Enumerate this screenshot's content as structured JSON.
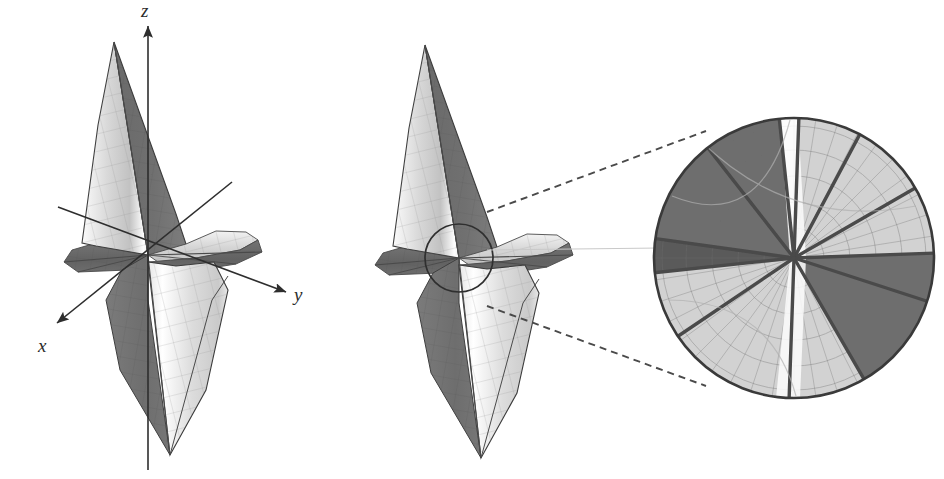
{
  "figure": {
    "type": "mathematical-surface-illustration",
    "rendering": "grayscale-shaded-mesh",
    "background_color": "#ffffff",
    "panels": [
      {
        "id": "left-panel",
        "name": "surface-with-axes",
        "description": "Grayscale saddle-type surface with coordinate axes drawn through the origin",
        "origin_px": [
          148,
          255
        ],
        "axes": [
          {
            "label": "z",
            "direction": "up",
            "tip_px": [
              148,
              24
            ],
            "tail_px": [
              148,
              470
            ],
            "label_px": [
              146,
              14
            ]
          },
          {
            "label": "y",
            "direction": "lower-right",
            "tip_px": [
              288,
              293
            ],
            "tail_px": [
              58,
              207
            ],
            "label_px": [
              296,
              300
            ]
          },
          {
            "label": "x",
            "direction": "lower-left",
            "tip_px": [
              55,
              325
            ],
            "tail_px": [
              232,
              182
            ],
            "label_px": [
              44,
              348
            ]
          }
        ]
      },
      {
        "id": "middle-panel",
        "name": "surface-with-highlight-circle",
        "description": "Same surface, axes omitted, with a small circle marking the neighbourhood of the origin",
        "origin_px": [
          459,
          258
        ],
        "highlight_circle": {
          "center_px": [
            459,
            258
          ],
          "radius_px": 34
        }
      },
      {
        "id": "right-panel",
        "name": "magnified-detail-disk",
        "description": "Circular magnification of the origin neighbourhood showing alternating light and dark radial wedge sectors meeting at the singular point",
        "disk": {
          "center_px": [
            794,
            258
          ],
          "radius_px": 140
        }
      }
    ],
    "callout": {
      "name": "magnifier-callout",
      "style": "dashed",
      "lines": [
        {
          "from_px": [
            487,
            213
          ],
          "to_px": [
            700,
            133
          ]
        },
        {
          "from_px": [
            487,
            305
          ],
          "to_px": [
            700,
            385
          ]
        }
      ]
    },
    "colors": {
      "outline": "#3a3a3a",
      "axis": "#2e2e2e",
      "label": "#2b2b2b",
      "dark_sector": "#6f6f6f",
      "mid_sector": "#9a9a9a",
      "light_sector": "#d2d2d2",
      "highlight_white": "#f8f8f8",
      "mesh_line": "#8d8d8d",
      "spoke": "#4a4a4a",
      "dashed_callout": "#4a4a4a"
    },
    "magnified_sectors": [
      {
        "index": 0,
        "start_deg": -92,
        "end_deg": -60,
        "tone": "light"
      },
      {
        "index": 1,
        "start_deg": -60,
        "end_deg": -18,
        "tone": "dark"
      },
      {
        "index": 2,
        "start_deg": -18,
        "end_deg": 2,
        "tone": "dark"
      },
      {
        "index": 3,
        "start_deg": 2,
        "end_deg": 30,
        "tone": "light"
      },
      {
        "index": 4,
        "start_deg": 30,
        "end_deg": 62,
        "tone": "light"
      },
      {
        "index": 5,
        "start_deg": 62,
        "end_deg": 88,
        "tone": "light"
      },
      {
        "index": 6,
        "start_deg": 88,
        "end_deg": 96,
        "tone": "white"
      },
      {
        "index": 7,
        "start_deg": 96,
        "end_deg": 128,
        "tone": "dark"
      },
      {
        "index": 8,
        "start_deg": 128,
        "end_deg": 172,
        "tone": "dark"
      },
      {
        "index": 9,
        "start_deg": 172,
        "end_deg": 186,
        "tone": "darker"
      },
      {
        "index": 10,
        "start_deg": 186,
        "end_deg": 214,
        "tone": "light"
      },
      {
        "index": 11,
        "start_deg": 214,
        "end_deg": 268,
        "tone": "light"
      }
    ],
    "labels": {
      "z": "z",
      "y": "y",
      "x": "x"
    }
  }
}
